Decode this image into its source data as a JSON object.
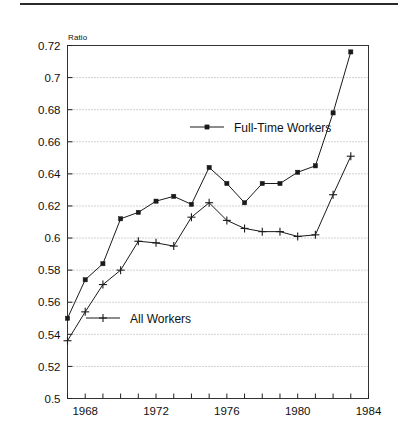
{
  "page": {
    "background": "#ffffff",
    "rule_color": "#2a2a2a"
  },
  "chart_data": {
    "type": "line",
    "title": "",
    "subtitle": "",
    "xlabel": "",
    "ylabel": "Ratio",
    "ylim": [
      0.5,
      0.72
    ],
    "xlim": [
      1967,
      1984
    ],
    "grid": true,
    "grid_style": "dotted-horizontal",
    "legend_position": "inside",
    "ytick_labels": [
      "0.5",
      "0.52",
      "0.54",
      "0.56",
      "0.58",
      "0.6",
      "0.62",
      "0.64",
      "0.66",
      "0.68",
      "0.7",
      "0.72"
    ],
    "ytick_values": [
      0.5,
      0.52,
      0.54,
      0.56,
      0.58,
      0.6,
      0.62,
      0.64,
      0.66,
      0.68,
      0.7,
      0.72
    ],
    "xtick_labels": [
      "1968",
      "1972",
      "1976",
      "1980",
      "1984"
    ],
    "xtick_values": [
      1968,
      1972,
      1976,
      1980,
      1984
    ],
    "xtick_minor_values": [
      1967,
      1969,
      1970,
      1971,
      1973,
      1974,
      1975,
      1977,
      1978,
      1979,
      1981,
      1982,
      1983
    ],
    "x": [
      1967,
      1968,
      1969,
      1970,
      1971,
      1972,
      1973,
      1974,
      1975,
      1976,
      1977,
      1978,
      1979,
      1980,
      1981,
      1982,
      1983
    ],
    "series": [
      {
        "name": "Full-Time Workers",
        "marker": "square",
        "color": "#1a1a1a",
        "values": [
          0.55,
          0.574,
          0.584,
          0.612,
          0.616,
          0.623,
          0.626,
          0.621,
          0.644,
          0.634,
          0.622,
          0.634,
          0.634,
          0.641,
          0.645,
          0.678,
          0.716
        ]
      },
      {
        "name": "All Workers",
        "marker": "plus",
        "color": "#1a1a1a",
        "values": [
          0.536,
          0.554,
          0.571,
          0.58,
          0.598,
          0.597,
          0.595,
          0.613,
          0.622,
          0.611,
          0.606,
          0.604,
          0.604,
          0.601,
          0.602,
          0.627,
          0.651
        ]
      }
    ],
    "annotations": []
  },
  "legend": {
    "items": [
      {
        "label": "Full-Time Workers",
        "marker": "square"
      },
      {
        "label": "All Workers",
        "marker": "plus"
      }
    ]
  }
}
